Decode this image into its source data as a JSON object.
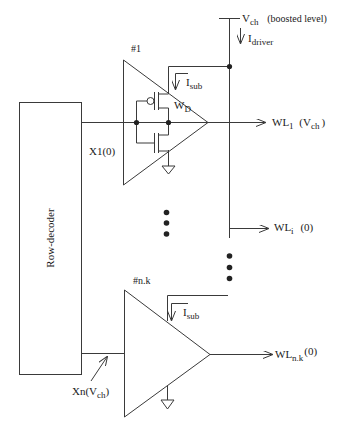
{
  "diagram": {
    "supply": {
      "name": "V",
      "sub": "ch",
      "note": "(boosted level)"
    },
    "driver_current": {
      "name": "I",
      "sub": "driver"
    },
    "row_decoder": {
      "label": "Row-decoder"
    },
    "driver_1": {
      "id": "#1",
      "input": "X1(0)",
      "leak_current": {
        "name": "I",
        "sub": "sub"
      },
      "device": {
        "name": "W",
        "sub": "D"
      },
      "output": {
        "name": "WL",
        "sub": "1",
        "state_pre": "(V",
        "state_sub": "ch",
        "state_post": ")"
      }
    },
    "wordline_i": {
      "name": "WL",
      "sub": "i",
      "state": "(0)"
    },
    "driver_nk": {
      "id": "#n.k",
      "input": {
        "pre": "Xn(V",
        "sub": "ch",
        "post": ")"
      },
      "leak_current": {
        "name": "I",
        "sub": "sub"
      },
      "output": {
        "name": "WL",
        "sub": "n.k",
        "state": "(0)"
      }
    },
    "colors": {
      "line": "#3a3a3a",
      "background": "#ffffff"
    }
  }
}
